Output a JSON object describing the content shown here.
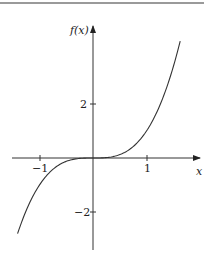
{
  "chart_data": {
    "type": "line",
    "title": "",
    "xlabel": "x",
    "ylabel": "f(x)",
    "function": "f(x) = x^3",
    "x": [
      -1.41,
      -1.2,
      -1.0,
      -0.8,
      -0.6,
      -0.4,
      -0.2,
      0,
      0.2,
      0.4,
      0.6,
      0.8,
      1.0,
      1.2,
      1.4,
      1.63
    ],
    "series": [
      {
        "name": "f(x)",
        "values": [
          -2.8,
          -1.728,
          -1.0,
          -0.512,
          -0.216,
          -0.064,
          -0.008,
          0,
          0.008,
          0.064,
          0.216,
          0.512,
          1.0,
          1.728,
          2.744,
          4.33
        ]
      }
    ],
    "x_ticks": [
      -1,
      1
    ],
    "y_ticks": [
      2,
      -2
    ],
    "x_tick_labels": [
      "−1",
      "1"
    ],
    "y_tick_labels": [
      "2",
      "−2"
    ],
    "xlim": [
      -1.72,
      1.9
    ],
    "ylim": [
      -3.5,
      5.4
    ],
    "grid": false,
    "legend": null
  },
  "labels": {
    "x_axis": "x",
    "y_axis": "f(x)",
    "tick_x_neg1": "−1",
    "tick_x_1": "1",
    "tick_y_2": "2",
    "tick_y_neg2": "−2"
  }
}
